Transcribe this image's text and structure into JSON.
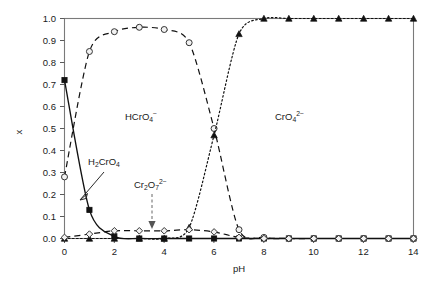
{
  "chart_data": {
    "type": "line",
    "title": "",
    "xlabel": "pH",
    "ylabel": "x",
    "xlim": [
      0,
      14
    ],
    "ylim": [
      0,
      1.0
    ],
    "grid": false,
    "legend": "inline-annotations",
    "x": [
      0,
      1,
      2,
      3,
      4,
      5,
      6,
      7,
      8,
      9,
      10,
      11,
      12,
      13,
      14
    ],
    "xticks": [
      0,
      2,
      4,
      6,
      8,
      10,
      12,
      14
    ],
    "xticklabels": [
      "0",
      "2",
      "4",
      "6",
      "8",
      "10",
      "12",
      "14"
    ],
    "yticks": [
      0.0,
      0.1,
      0.2,
      0.3,
      0.4,
      0.5,
      0.6,
      0.7,
      0.8,
      0.9,
      1.0
    ],
    "yticklabels": [
      "0.0",
      "0.1",
      "0.2",
      "0.3",
      "0.4",
      "0.5",
      "0.6",
      "0.7",
      "0.8",
      "0.9",
      "1.0"
    ],
    "series": [
      {
        "name": "H2CrO4",
        "label_html": "H<sub>2</sub>CrO<sub>4</sub>",
        "linestyle": "solid",
        "marker": "filled-square",
        "values": [
          0.72,
          0.13,
          0.01,
          0.0,
          0.0,
          0.0,
          0.0,
          0.0,
          0.0,
          0.0,
          0.0,
          0.0,
          0.0,
          0.0,
          0.0
        ]
      },
      {
        "name": "HCrO4-",
        "label_html": "HCrO<sub>4</sub><sup>-</sup>",
        "linestyle": "dashed",
        "marker": "open-circle",
        "values": [
          0.28,
          0.85,
          0.94,
          0.96,
          0.95,
          0.89,
          0.5,
          0.04,
          0.005,
          0.0,
          0.0,
          0.0,
          0.0,
          0.0,
          0.0
        ]
      },
      {
        "name": "CrO4 2-",
        "label_html": "CrO<sub>4</sub><sup>2-</sup>",
        "linestyle": "dotted",
        "marker": "filled-triangle",
        "values": [
          0.0,
          0.0,
          0.0,
          0.0,
          0.0,
          0.05,
          0.47,
          0.93,
          1.0,
          1.0,
          1.0,
          1.0,
          1.0,
          1.0,
          1.0
        ]
      },
      {
        "name": "Cr2O7 2-",
        "label_html": "Cr<sub>2</sub>O<sub>7</sub><sup>2-</sup>",
        "linestyle": "dashed",
        "marker": "open-diamond",
        "values": [
          0.005,
          0.02,
          0.035,
          0.035,
          0.035,
          0.04,
          0.03,
          0.005,
          0.0,
          0.0,
          0.0,
          0.0,
          0.0,
          0.0,
          0.0
        ]
      }
    ],
    "annotations": [
      {
        "name": "h2cro4-label",
        "text": "H2CrO4",
        "kind": "arrow-callout"
      },
      {
        "name": "hcro4-label",
        "text": "HCrO4-",
        "kind": "region-label"
      },
      {
        "name": "cro4-label",
        "text": "CrO4 2-",
        "kind": "region-label"
      },
      {
        "name": "cr2o7-label",
        "text": "Cr2O7 2-",
        "kind": "dashed-pointer"
      }
    ]
  },
  "labels": {
    "x_axis_title": "pH",
    "y_axis_title": "x",
    "h2cro4": {
      "base": "H",
      "sub1": "2",
      "mid": "CrO",
      "sub2": "4"
    },
    "hcro4": {
      "base": "HCrO",
      "sub": "4",
      "sup": "−"
    },
    "cro4": {
      "base": "CrO",
      "sub": "4",
      "sup": "2−"
    },
    "cr2o7": {
      "base": "Cr",
      "sub1": "2",
      "mid": "O",
      "sub2": "7",
      "sup": "2−"
    }
  },
  "colors": {
    "background": "#ffffff",
    "axis": "#7a7a7a",
    "curve": "#111111",
    "marker_fill_open": "#f2f2f2",
    "text": "#1a1a1a"
  }
}
